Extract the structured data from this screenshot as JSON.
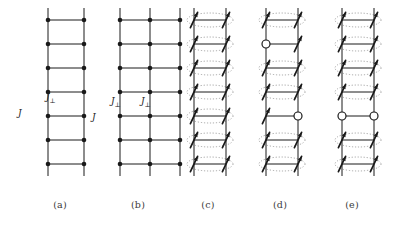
{
  "figure": {
    "width": 408,
    "height": 229,
    "background": "#ffffff",
    "ink_color": "#1a1a1a",
    "dotted_color": "#9a9a9a",
    "caption_color": "#3a3a3a"
  },
  "panels": [
    {
      "id": "a",
      "caption": "(a)",
      "x": 28,
      "caption_x": 28,
      "caption_width": 64,
      "type": "two-leg-ladder",
      "legs": 2,
      "rungs": 7,
      "leg_spacing": 36,
      "rung_spacing": 24,
      "top_y": 20,
      "site_radius": 2.3,
      "leg_overhang": 12,
      "has_spins": false,
      "has_holes": false,
      "has_singlet_ovals": false,
      "labels": [
        {
          "text": "J",
          "sub": "⊥",
          "x": 46,
          "y": 92,
          "name": "j-perp-label"
        },
        {
          "text": "J",
          "sub": "",
          "x": 18,
          "y": 108,
          "name": "j-leg-label"
        }
      ],
      "holes": []
    },
    {
      "id": "b",
      "caption": "(b)",
      "x": 100,
      "caption_x": 100,
      "caption_width": 76,
      "type": "three-leg-ladder",
      "legs": 3,
      "rungs": 7,
      "leg_spacing": 30,
      "rung_spacing": 24,
      "top_y": 20,
      "site_radius": 2.3,
      "leg_overhang": 12,
      "has_spins": false,
      "has_holes": false,
      "has_singlet_ovals": false,
      "labels": [
        {
          "text": "J",
          "sub": "⊥",
          "x": 111,
          "y": 96,
          "name": "j-perp-label-left"
        },
        {
          "text": "J",
          "sub": "⊥",
          "x": 141,
          "y": 96,
          "name": "j-perp-label-right"
        },
        {
          "text": "J",
          "sub": "",
          "x": 92,
          "y": 112,
          "name": "j-leg-label"
        }
      ],
      "holes": []
    },
    {
      "id": "c",
      "caption": "(c)",
      "x": 174,
      "caption_x": 176,
      "caption_width": 64,
      "type": "rung-singlet-state",
      "legs": 2,
      "rungs": 7,
      "leg_spacing": 32,
      "rung_spacing": 24,
      "top_y": 20,
      "site_radius": 0,
      "leg_overhang": 12,
      "has_spins": true,
      "has_holes": false,
      "has_singlet_ovals": true,
      "labels": [],
      "holes": []
    },
    {
      "id": "d",
      "caption": "(d)",
      "x": 246,
      "caption_x": 248,
      "caption_width": 64,
      "type": "two-separated-holes",
      "legs": 2,
      "rungs": 7,
      "leg_spacing": 32,
      "rung_spacing": 24,
      "top_y": 20,
      "site_radius": 0,
      "leg_overhang": 12,
      "has_spins": true,
      "has_holes": true,
      "has_singlet_ovals": true,
      "labels": [],
      "holes": [
        {
          "row": 1,
          "leg": 0,
          "name": "hole-left-leg"
        },
        {
          "row": 4,
          "leg": 1,
          "name": "hole-right-leg"
        }
      ]
    },
    {
      "id": "e",
      "caption": "(e)",
      "x": 322,
      "caption_x": 316,
      "caption_width": 72,
      "type": "bound-hole-pair",
      "legs": 2,
      "rungs": 7,
      "leg_spacing": 32,
      "rung_spacing": 24,
      "top_y": 20,
      "site_radius": 0,
      "leg_overhang": 12,
      "has_spins": true,
      "has_holes": true,
      "has_singlet_ovals": true,
      "labels": [],
      "holes": [
        {
          "row": 4,
          "leg": 0,
          "name": "hole-pair-left"
        },
        {
          "row": 4,
          "leg": 1,
          "name": "hole-pair-right"
        }
      ]
    }
  ],
  "captions_y": 199,
  "spin": {
    "length": 17,
    "angle_deg": -65,
    "head_length": 5,
    "stroke_width": 1.7
  },
  "hole_marker": {
    "radius": 4,
    "fill": "#ffffff",
    "stroke": "#1a1a1a",
    "stroke_width": 1.2
  }
}
